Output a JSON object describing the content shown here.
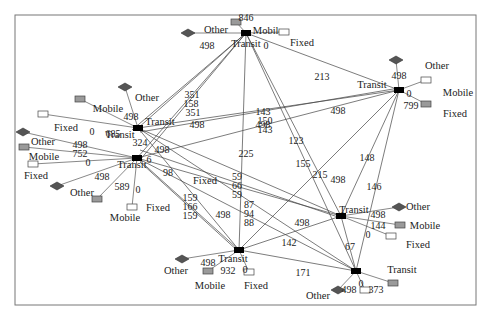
{
  "diagram": {
    "title": "",
    "frame": {
      "x": 15,
      "y": 15,
      "w": 461,
      "h": 290
    },
    "colors": {
      "transit": "#000000",
      "other": "#555555",
      "mobile": "#9a9a9a",
      "fixed": "#ffffff",
      "edge": "#444444"
    },
    "transit_nodes": [
      {
        "id": "T1",
        "x": 246,
        "y": 33,
        "label": "Transit",
        "lx": 246,
        "ly": 47
      },
      {
        "id": "T2",
        "x": 138,
        "y": 128,
        "label": "Transit",
        "lx": 160,
        "ly": 125
      },
      {
        "id": "T3",
        "x": 137,
        "y": 158,
        "label": "Transit",
        "lx": 132,
        "ly": 168
      },
      {
        "id": "T4",
        "x": 399,
        "y": 90,
        "label": "Transit",
        "lx": 372,
        "ly": 88
      },
      {
        "id": "T5",
        "x": 341,
        "y": 216,
        "label": "Transit",
        "lx": 354,
        "ly": 213
      },
      {
        "id": "T6",
        "x": 239,
        "y": 250,
        "label": "Transit",
        "lx": 233,
        "ly": 262
      },
      {
        "id": "T7",
        "x": 356,
        "y": 271,
        "label": "Transit",
        "lx": 402,
        "ly": 273
      },
      {
        "id": "T8",
        "x": 138,
        "y": 128,
        "label": "Transit",
        "lx": 120,
        "ly": 138
      }
    ],
    "leaf_nodes": [
      {
        "name": "Other",
        "shape": "diamond",
        "x": 188,
        "y": 33,
        "label": "Other",
        "lx": 216,
        "ly": 33
      },
      {
        "name": "Mobile",
        "shape": "grayrect",
        "x": 236,
        "y": 22,
        "label": "Mobile",
        "lx": 268,
        "ly": 34
      },
      {
        "name": "Fixed",
        "shape": "whiterect",
        "x": 284,
        "y": 32,
        "label": "Fixed",
        "lx": 302,
        "ly": 46
      },
      {
        "name": "Other",
        "shape": "diamond",
        "x": 125,
        "y": 87,
        "label": "Other",
        "lx": 147,
        "ly": 101
      },
      {
        "name": "Mobile",
        "shape": "grayrect",
        "x": 80,
        "y": 99,
        "label": "Mobile",
        "lx": 108,
        "ly": 112
      },
      {
        "name": "Fixed",
        "shape": "whiterect",
        "x": 43,
        "y": 114,
        "label": "Fixed",
        "lx": 66,
        "ly": 131
      },
      {
        "name": "Other",
        "shape": "diamond",
        "x": 23,
        "y": 132,
        "label": "Other",
        "lx": 43,
        "ly": 145
      },
      {
        "name": "Mobile",
        "shape": "grayrect",
        "x": 24,
        "y": 147,
        "label": "Mobile",
        "lx": 44,
        "ly": 160
      },
      {
        "name": "Fixed",
        "shape": "whiterect",
        "x": 33,
        "y": 164,
        "label": "",
        "lx": 0,
        "ly": 0
      },
      {
        "name": "Fixed",
        "shape": "diamond",
        "x": 57,
        "y": 186,
        "label": "Fixed",
        "lx": 36,
        "ly": 179
      },
      {
        "name": "Other",
        "shape": "grayrect",
        "x": 97,
        "y": 199,
        "label": "Other",
        "lx": 82,
        "ly": 196
      },
      {
        "name": "Mobile",
        "shape": "whiterect",
        "x": 132,
        "y": 207,
        "label": "Mobile",
        "lx": 125,
        "ly": 221
      },
      {
        "name": "Other",
        "shape": "diamond",
        "x": 396,
        "y": 60,
        "label": "Other",
        "lx": 437,
        "ly": 69
      },
      {
        "name": "Mobile",
        "shape": "whiterect",
        "x": 426,
        "y": 80,
        "label": "Mobile",
        "lx": 458,
        "ly": 96
      },
      {
        "name": "Fixed",
        "shape": "grayrect",
        "x": 426,
        "y": 104,
        "label": "Fixed",
        "lx": 455,
        "ly": 117
      },
      {
        "name": "Other",
        "shape": "diamond",
        "x": 399,
        "y": 207,
        "label": "Other",
        "lx": 418,
        "ly": 210
      },
      {
        "name": "Mobile",
        "shape": "grayrect",
        "x": 400,
        "y": 225,
        "label": "Mobile",
        "lx": 425,
        "ly": 229
      },
      {
        "name": "Fixed",
        "shape": "whiterect",
        "x": 391,
        "y": 236,
        "label": "Fixed",
        "lx": 418,
        "ly": 248
      },
      {
        "name": "Other",
        "shape": "diamond",
        "x": 182,
        "y": 259,
        "label": "Other",
        "lx": 176,
        "ly": 274
      },
      {
        "name": "Mobile",
        "shape": "grayrect",
        "x": 208,
        "y": 271,
        "label": "Mobile",
        "lx": 210,
        "ly": 289
      },
      {
        "name": "Fixed",
        "shape": "whiterect",
        "x": 249,
        "y": 272,
        "label": "Fixed",
        "lx": 256,
        "ly": 289
      },
      {
        "name": "Other",
        "shape": "diamond",
        "x": 338,
        "y": 290,
        "label": "Other",
        "lx": 318,
        "ly": 299
      },
      {
        "name": "Fixed",
        "shape": "whiterect",
        "x": 365,
        "y": 290,
        "label": "",
        "lx": 0,
        "ly": 0
      },
      {
        "name": "Mobile",
        "shape": "grayrect",
        "x": 393,
        "y": 283,
        "label": "",
        "lx": 0,
        "ly": 0
      }
    ],
    "edges": [
      [
        246,
        33,
        138,
        128
      ],
      [
        246,
        33,
        137,
        158
      ],
      [
        246,
        33,
        132,
        130
      ],
      [
        246,
        33,
        140,
        160
      ],
      [
        246,
        33,
        399,
        90
      ],
      [
        246,
        33,
        239,
        250
      ],
      [
        246,
        33,
        341,
        216
      ],
      [
        246,
        33,
        356,
        271
      ],
      [
        138,
        128,
        399,
        90
      ],
      [
        137,
        158,
        399,
        90
      ],
      [
        140,
        132,
        399,
        88
      ],
      [
        138,
        128,
        341,
        216
      ],
      [
        137,
        158,
        341,
        216
      ],
      [
        140,
        150,
        341,
        218
      ],
      [
        138,
        128,
        239,
        250
      ],
      [
        137,
        158,
        239,
        250
      ],
      [
        140,
        162,
        239,
        252
      ],
      [
        138,
        128,
        356,
        271
      ],
      [
        137,
        158,
        356,
        271
      ],
      [
        399,
        90,
        341,
        216
      ],
      [
        399,
        90,
        356,
        271
      ],
      [
        399,
        90,
        239,
        250
      ],
      [
        341,
        216,
        239,
        250
      ],
      [
        341,
        216,
        356,
        271
      ],
      [
        239,
        250,
        356,
        271
      ]
    ],
    "leaf_edges": [
      [
        246,
        33,
        188,
        33
      ],
      [
        246,
        33,
        236,
        22
      ],
      [
        246,
        33,
        284,
        32
      ],
      [
        138,
        128,
        125,
        87
      ],
      [
        138,
        128,
        80,
        99
      ],
      [
        138,
        128,
        43,
        114
      ],
      [
        137,
        158,
        23,
        132
      ],
      [
        137,
        158,
        24,
        147
      ],
      [
        137,
        158,
        33,
        164
      ],
      [
        137,
        158,
        57,
        186
      ],
      [
        137,
        158,
        97,
        199
      ],
      [
        137,
        158,
        132,
        207
      ],
      [
        399,
        90,
        396,
        60
      ],
      [
        399,
        90,
        426,
        80
      ],
      [
        399,
        90,
        426,
        104
      ],
      [
        341,
        216,
        399,
        207
      ],
      [
        341,
        216,
        400,
        225
      ],
      [
        341,
        216,
        391,
        236
      ],
      [
        239,
        250,
        182,
        259
      ],
      [
        239,
        250,
        208,
        271
      ],
      [
        239,
        250,
        249,
        272
      ],
      [
        356,
        271,
        338,
        290
      ],
      [
        356,
        271,
        365,
        290
      ],
      [
        356,
        271,
        393,
        283
      ]
    ],
    "edge_labels": [
      {
        "t": "498",
        "x": 207,
        "y": 49
      },
      {
        "t": "846",
        "x": 246,
        "y": 21
      },
      {
        "t": "0",
        "x": 266,
        "y": 49
      },
      {
        "t": "213",
        "x": 322,
        "y": 80
      },
      {
        "t": "498",
        "x": 131,
        "y": 120
      },
      {
        "t": "685",
        "x": 113,
        "y": 137
      },
      {
        "t": "0",
        "x": 92,
        "y": 135
      },
      {
        "t": "324",
        "x": 140,
        "y": 146
      },
      {
        "t": "6",
        "x": 149,
        "y": 163
      },
      {
        "t": "498",
        "x": 80,
        "y": 148
      },
      {
        "t": "752",
        "x": 80,
        "y": 157
      },
      {
        "t": "0",
        "x": 88,
        "y": 166
      },
      {
        "t": "498",
        "x": 102,
        "y": 180
      },
      {
        "t": "589",
        "x": 122,
        "y": 190
      },
      {
        "t": "0",
        "x": 138,
        "y": 193
      },
      {
        "t": "351",
        "x": 192,
        "y": 98
      },
      {
        "t": "158",
        "x": 191,
        "y": 107
      },
      {
        "t": "351",
        "x": 193,
        "y": 116
      },
      {
        "t": "498",
        "x": 197,
        "y": 128
      },
      {
        "t": "498",
        "x": 162,
        "y": 153
      },
      {
        "t": "498",
        "x": 263,
        "y": 128
      },
      {
        "t": "143",
        "x": 263,
        "y": 115
      },
      {
        "t": "150",
        "x": 265,
        "y": 124
      },
      {
        "t": "143",
        "x": 265,
        "y": 133
      },
      {
        "t": "498",
        "x": 338,
        "y": 114
      },
      {
        "t": "123",
        "x": 296,
        "y": 144
      },
      {
        "t": "225",
        "x": 246,
        "y": 157
      },
      {
        "t": "155",
        "x": 303,
        "y": 167
      },
      {
        "t": "215",
        "x": 320,
        "y": 178
      },
      {
        "t": "498",
        "x": 338,
        "y": 183
      },
      {
        "t": "148",
        "x": 367,
        "y": 161
      },
      {
        "t": "146",
        "x": 374,
        "y": 190
      },
      {
        "t": "59",
        "x": 237,
        "y": 180
      },
      {
        "t": "66",
        "x": 237,
        "y": 189
      },
      {
        "t": "59",
        "x": 237,
        "y": 198
      },
      {
        "t": "98",
        "x": 168,
        "y": 176
      },
      {
        "t": "159",
        "x": 190,
        "y": 201
      },
      {
        "t": "166",
        "x": 190,
        "y": 210
      },
      {
        "t": "159",
        "x": 190,
        "y": 219
      },
      {
        "t": "498",
        "x": 223,
        "y": 218
      },
      {
        "t": "87",
        "x": 249,
        "y": 208
      },
      {
        "t": "94",
        "x": 249,
        "y": 217
      },
      {
        "t": "88",
        "x": 249,
        "y": 226
      },
      {
        "t": "498",
        "x": 302,
        "y": 226
      },
      {
        "t": "142",
        "x": 289,
        "y": 246
      },
      {
        "t": "171",
        "x": 303,
        "y": 276
      },
      {
        "t": "498",
        "x": 378,
        "y": 218
      },
      {
        "t": "144",
        "x": 378,
        "y": 229
      },
      {
        "t": "0",
        "x": 368,
        "y": 238
      },
      {
        "t": "67",
        "x": 350,
        "y": 250
      },
      {
        "t": "498",
        "x": 208,
        "y": 266
      },
      {
        "t": "932",
        "x": 228,
        "y": 274
      },
      {
        "t": "0",
        "x": 245,
        "y": 273
      },
      {
        "t": "498",
        "x": 399,
        "y": 79
      },
      {
        "t": "0",
        "x": 409,
        "y": 97
      },
      {
        "t": "799",
        "x": 411,
        "y": 109
      },
      {
        "t": "498",
        "x": 349,
        "y": 293
      },
      {
        "t": "0",
        "x": 361,
        "y": 287
      },
      {
        "t": "373",
        "x": 376,
        "y": 293
      }
    ],
    "free_labels": [
      {
        "t": "Fixed",
        "x": 205,
        "y": 184
      },
      {
        "t": "Fixed",
        "x": 158,
        "y": 211
      }
    ]
  }
}
